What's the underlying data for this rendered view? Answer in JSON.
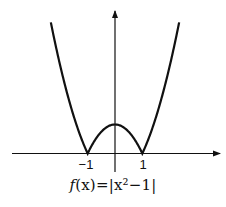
{
  "chart_data": {
    "type": "line",
    "title": "",
    "caption": "f(x)=|x²−1|",
    "function": "|x^2 - 1|",
    "xlabel": "",
    "ylabel": "",
    "x_ticks": [
      -1,
      1
    ],
    "x_tick_labels": [
      "−1",
      "1"
    ],
    "xlim": [
      -3.8,
      3.8
    ],
    "ylim": [
      -0.7,
      4.9
    ],
    "grid": false,
    "legend": null,
    "series": [
      {
        "name": "f(x)=|x²−1|",
        "x": [
          -2.35,
          -2.0,
          -1.5,
          -1.0,
          -0.5,
          0,
          0.5,
          1.0,
          1.5,
          2.0,
          2.35
        ],
        "values": [
          4.52,
          3.0,
          1.25,
          0,
          0.75,
          1.0,
          0.75,
          0,
          1.25,
          3.0,
          4.52
        ]
      }
    ],
    "key_points": [
      {
        "x": -1,
        "y": 0,
        "label": "−1"
      },
      {
        "x": 0,
        "y": 1
      },
      {
        "x": 1,
        "y": 0,
        "label": "1"
      }
    ]
  },
  "labels": {
    "tick_neg1": "−1",
    "tick_pos1": "1",
    "caption_f": "f",
    "caption_rest": "(x)=|x²−1|"
  },
  "colors": {
    "curve": "#111111",
    "axis": "#111111",
    "background": "#ffffff"
  }
}
